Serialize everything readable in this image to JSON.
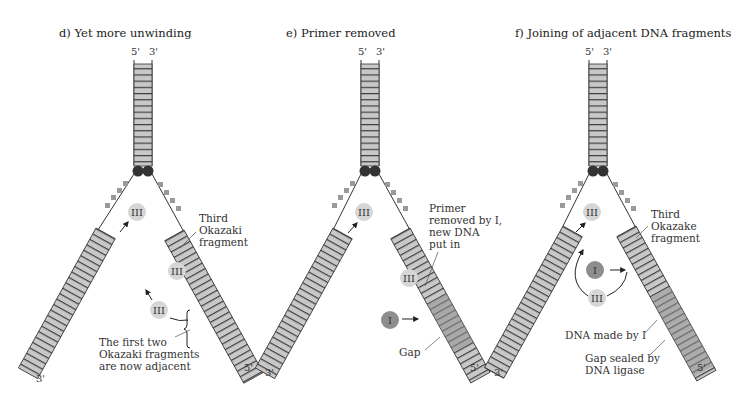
{
  "colors": {
    "strand_fill": "#c8c8c8",
    "new_dna_fill": "#8f8f8f",
    "rung": "#333333",
    "enzyme_III": "#d6d6d6",
    "enzyme_I": "#8e8e8e",
    "helicase": "#333333",
    "ssb": "#9a9a9a"
  },
  "panels": [
    {
      "title": "d) Yet more unwinding",
      "top_5": "5'",
      "top_3": "3'",
      "bottom_left": "3'",
      "bottom_right": "5'",
      "enzymes": [
        "III",
        "III",
        "III"
      ],
      "labels": {
        "third_fragment": [
          "Third",
          "Okazaki",
          "fragment"
        ],
        "adjacent": [
          "The first two",
          "Okazaki fragments",
          "are now adjacent"
        ]
      }
    },
    {
      "title": "e) Primer removed",
      "top_5": "5'",
      "top_3": "3'",
      "bottom_left": "3'",
      "bottom_right": "5'",
      "enzymes": [
        "III",
        "III",
        "I"
      ],
      "labels": {
        "primer_removed": [
          "Primer",
          "removed by I,",
          "new DNA",
          "put in"
        ],
        "gap": "Gap"
      }
    },
    {
      "title": "f) Joining of adjacent DNA fragments",
      "top_5": "5'",
      "top_3": "3'",
      "bottom_left": "3'",
      "bottom_right": "5'",
      "enzymes": [
        "III",
        "I",
        "III"
      ],
      "labels": {
        "third_fragment": [
          "Third",
          "Okazake",
          "fragment"
        ],
        "dna_made": "DNA made by I",
        "gap_sealed": [
          "Gap sealed by",
          "DNA ligase"
        ]
      }
    }
  ]
}
